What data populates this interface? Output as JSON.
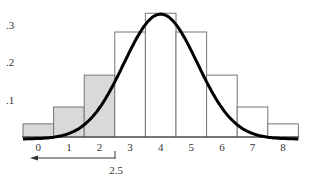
{
  "chart_data": {
    "type": "bar",
    "title": "",
    "xlabel": "",
    "ylabel": "",
    "categories": [
      "0",
      "1",
      "2",
      "3",
      "4",
      "5",
      "6",
      "7",
      "8"
    ],
    "values": [
      0.035,
      0.08,
      0.165,
      0.28,
      0.33,
      0.28,
      0.165,
      0.08,
      0.035
    ],
    "shaded_categories": [
      "0",
      "1",
      "2"
    ],
    "overlay": {
      "type": "normal-curve",
      "mean": 4,
      "sd": 1.2
    },
    "yticks": [
      ".1",
      ".2",
      ".3"
    ],
    "ytick_values": [
      0.1,
      0.2,
      0.3
    ],
    "annotation": {
      "label": "2.5",
      "x": 2.5,
      "arrow_direction": "left"
    },
    "ylim": [
      0,
      0.35
    ],
    "grid": false,
    "legend": "none"
  },
  "colors": {
    "shaded_fill": "#d9d9d9",
    "bar_stroke": "#777777",
    "curve": "#000000"
  }
}
